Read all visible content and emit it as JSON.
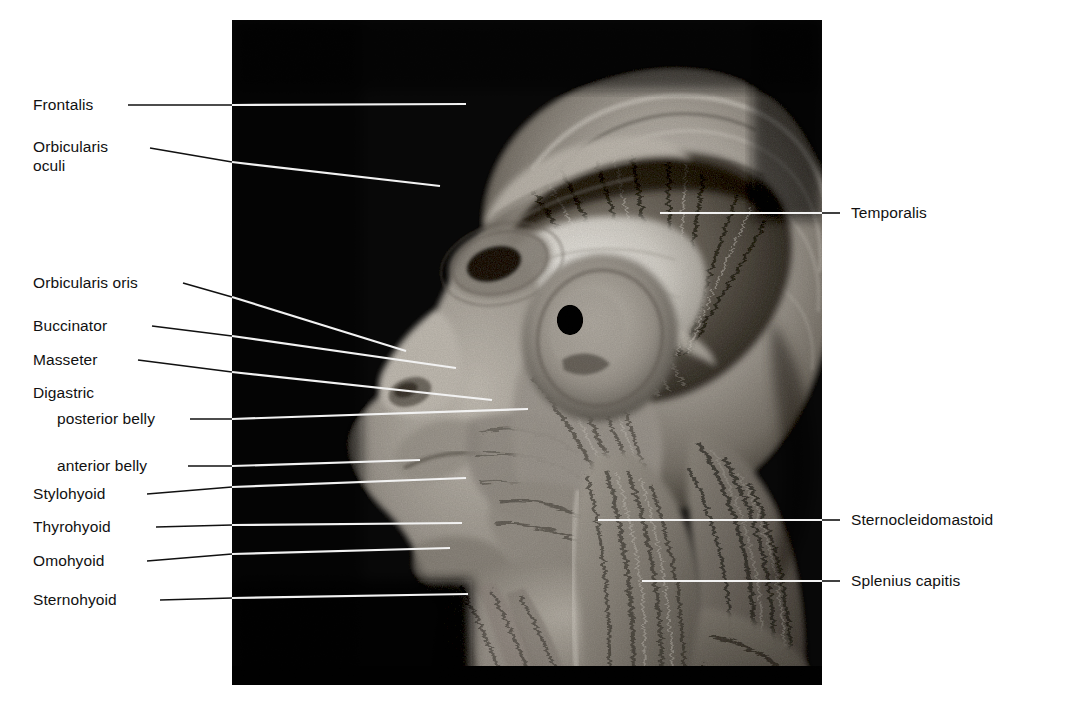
{
  "figure": {
    "kind": "anatomical-photograph",
    "background_color": "#080808",
    "page_color": "#ffffff",
    "label_color": "#111111",
    "leader_color_outside": "#111111",
    "leader_color_inside": "#f2f2f2",
    "plate": {
      "x": 232,
      "y": 20,
      "width": 590,
      "height": 665
    }
  },
  "labels_left": [
    {
      "text": "Frontalis",
      "indent": false
    },
    {
      "text": "Orbicularis",
      "indent": false
    },
    {
      "text": "oculi",
      "indent": false
    },
    {
      "text": "Orbicularis oris",
      "indent": false
    },
    {
      "text": "Buccinator",
      "indent": false
    },
    {
      "text": "Masseter",
      "indent": false
    },
    {
      "text": "Digastric",
      "indent": false
    },
    {
      "text": "posterior belly",
      "indent": true
    },
    {
      "text": "anterior belly",
      "indent": true
    },
    {
      "text": "Stylohyoid",
      "indent": false
    },
    {
      "text": "Thyrohyoid",
      "indent": false
    },
    {
      "text": "Omohyoid",
      "indent": false
    },
    {
      "text": "Sternohyoid",
      "indent": false
    }
  ],
  "labels_right": [
    {
      "text": "Temporalis"
    },
    {
      "text": "Sternocleidomastoid"
    },
    {
      "text": "Splenius capitis"
    }
  ]
}
